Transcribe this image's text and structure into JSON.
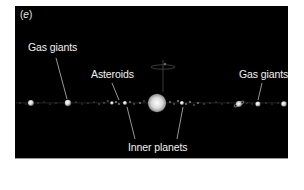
{
  "figure": {
    "panel_label_open": "(",
    "panel_label_letter": "e",
    "panel_label_close": ")",
    "background_color": "#000000",
    "label_color": "#f2f2f2"
  },
  "labels": {
    "gas_giants_left": "Gas giants",
    "asteroids": "Asteroids",
    "gas_giants_right": "Gas giants",
    "inner_planets": "Inner planets"
  },
  "scene": {
    "sun": {
      "x": 157,
      "y": 103,
      "r": 9
    },
    "planets": [
      {
        "name": "outer-left-1",
        "x": 31,
        "y": 103,
        "r": 3
      },
      {
        "name": "gas-giant-left",
        "x": 68,
        "y": 103,
        "r": 3.2
      },
      {
        "name": "inner-left",
        "x": 125,
        "y": 103,
        "r": 2
      },
      {
        "name": "inner-left-2",
        "x": 112,
        "y": 103,
        "r": 1.8
      },
      {
        "name": "inner-right",
        "x": 182,
        "y": 103,
        "r": 2
      },
      {
        "name": "gas-giant-ringed",
        "x": 239,
        "y": 104,
        "r": 3
      },
      {
        "name": "gas-giant-right",
        "x": 258,
        "y": 104,
        "r": 2.6
      },
      {
        "name": "outer-right",
        "x": 284,
        "y": 104,
        "r": 2.8
      }
    ]
  }
}
